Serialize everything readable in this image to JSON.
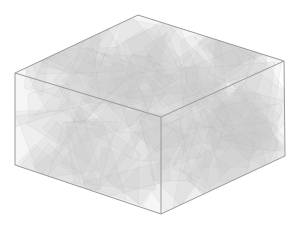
{
  "figure": {
    "colors": {
      "background": "#ffffff",
      "box_edge": "#9a9a9a",
      "plane_fill": "#c8c8c8",
      "plane_edge": "#a8a8a8"
    },
    "plane_count": 90,
    "random_seed": 7
  }
}
